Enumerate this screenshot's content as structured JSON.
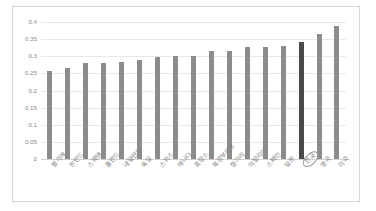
{
  "chart_data": {
    "type": "bar",
    "title": "",
    "subtitle": "",
    "xlabel": "",
    "ylabel": "",
    "ylim": [
      0,
      0.4
    ],
    "yticks": [
      "0",
      "0.05",
      "0.1",
      "0.15",
      "0.2",
      "0.25",
      "0.3",
      "0.35",
      "0.4"
    ],
    "ytick_values": [
      0,
      0.05,
      0.1,
      0.15,
      0.2,
      0.25,
      0.3,
      0.35,
      0.4
    ],
    "grid": true,
    "legend": "none",
    "categories": [
      "벨기에",
      "핀란드",
      "스웨덴",
      "폴란드",
      "네덜란드",
      "독일",
      "스위스",
      "캐나다",
      "프랑스",
      "룩셈부르크",
      "헝가리",
      "이탈리아",
      "스페인",
      "일본",
      "한국",
      "영국",
      "미국"
    ],
    "values": [
      0.257,
      0.267,
      0.28,
      0.28,
      0.284,
      0.289,
      0.298,
      0.301,
      0.301,
      0.316,
      0.314,
      0.327,
      0.327,
      0.331,
      0.342,
      0.364,
      0.389
    ],
    "highlight_index": 14,
    "highlight_label": "한국",
    "annotations": [
      {
        "type": "ellipse",
        "target": "한국",
        "note": "category label circled"
      }
    ],
    "colors": {
      "bar": "#8c8c8c",
      "bar_highlight": "#4a4a4a",
      "gridline": "#e8e8e8",
      "axis": "#d2d2d2",
      "border": "#d6d6d6",
      "background": "#ffffff",
      "tick_text": "#8a8a8a"
    }
  }
}
